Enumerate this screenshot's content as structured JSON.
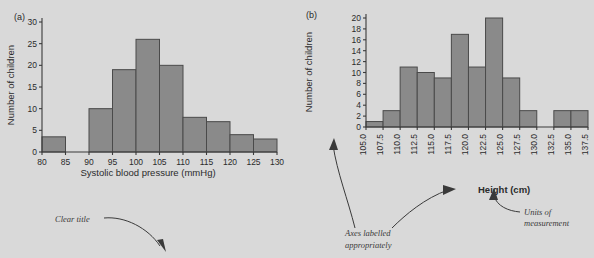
{
  "figure": {
    "background_color": "#d9d9d9",
    "bar_fill": "#8a8a8a",
    "bar_edge": "#4a4a4a",
    "panel_a_letter": "(a)",
    "panel_b_letter": "(b)"
  },
  "annotations": [
    {
      "id": "clear-title",
      "text": "Clear title"
    },
    {
      "id": "axes-labelled",
      "line1": "Axes labelled",
      "line2": "appropriately"
    },
    {
      "id": "units",
      "line1": "Units of",
      "line2": "measurement"
    }
  ],
  "chart_data": [
    {
      "id": "panel-a",
      "type": "bar",
      "title": "",
      "xlabel": "Systolic blood pressure (mmHg)",
      "ylabel": "Number of children",
      "xlim": [
        80,
        130
      ],
      "ylim": [
        0,
        30
      ],
      "xticks": [
        80,
        85,
        90,
        95,
        100,
        105,
        110,
        115,
        120,
        125,
        130
      ],
      "xticklabels": [
        "80",
        "85",
        "90",
        "95",
        "100",
        "105",
        "110",
        "115",
        "120",
        "125",
        "130"
      ],
      "yticks": [
        0,
        5,
        10,
        15,
        20,
        25,
        30
      ],
      "yticklabels": [
        "0",
        "5",
        "10",
        "15",
        "20",
        "25",
        "30"
      ],
      "bin_edges": [
        80,
        85,
        90,
        95,
        100,
        105,
        110,
        115,
        120,
        125,
        130
      ],
      "bin_labels": [
        "80-85",
        "85-90",
        "90-95",
        "95-100",
        "100-105",
        "105-110",
        "110-115",
        "115-120",
        "120-125",
        "125-130"
      ],
      "values": [
        3.5,
        0,
        10,
        19,
        26,
        20,
        8,
        7,
        4,
        3
      ],
      "grid": false,
      "legend": "none"
    },
    {
      "id": "panel-b",
      "type": "bar",
      "title": "",
      "xlabel": "Height (cm)",
      "ylabel": "Number of children",
      "xlim": [
        105.0,
        137.5
      ],
      "ylim": [
        0,
        20
      ],
      "xticks": [
        105.0,
        107.5,
        110.0,
        112.5,
        115.0,
        117.5,
        120.0,
        122.5,
        125.0,
        127.5,
        130.0,
        132.5,
        135.0,
        137.5
      ],
      "xticklabels": [
        "105.0",
        "107.5",
        "110.0",
        "112.5",
        "115.0",
        "117.5",
        "120.0",
        "122.5",
        "125.0",
        "127.5",
        "130.0",
        "132.5",
        "135.0",
        "137.5"
      ],
      "yticks": [
        0,
        2,
        4,
        6,
        8,
        10,
        12,
        14,
        16,
        18,
        20
      ],
      "yticklabels": [
        "0",
        "2",
        "4",
        "6",
        "8",
        "10",
        "12",
        "14",
        "16",
        "18",
        "20"
      ],
      "bin_edges": [
        105.0,
        107.5,
        110.0,
        112.5,
        115.0,
        117.5,
        120.0,
        122.5,
        125.0,
        127.5,
        130.0,
        132.5,
        135.0,
        137.5
      ],
      "bin_labels": [
        "105.0-107.5",
        "107.5-110.0",
        "110.0-112.5",
        "112.5-115.0",
        "115.0-117.5",
        "117.5-120.0",
        "120.0-122.5",
        "122.5-125.0",
        "125.0-127.5",
        "127.5-130.0",
        "130.0-132.5",
        "132.5-135.0",
        "135.0-137.5"
      ],
      "values": [
        1,
        3,
        11,
        10,
        9,
        17,
        11,
        20,
        9,
        3,
        0,
        3,
        3
      ],
      "grid": false,
      "legend": "none"
    }
  ]
}
